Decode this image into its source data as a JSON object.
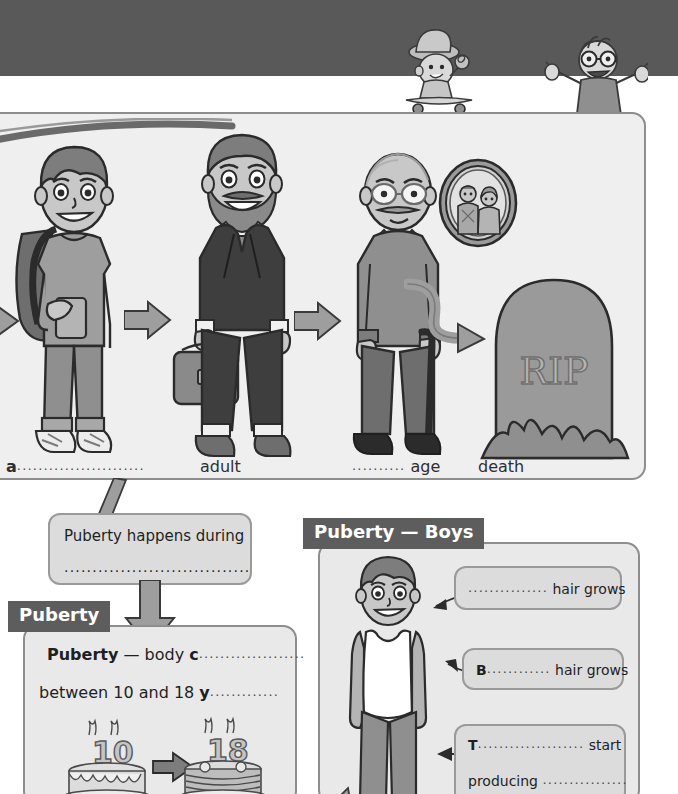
{
  "page": {
    "header_band_color": "#595959",
    "paper_color": "#ffffff"
  },
  "header_illustrations": [
    {
      "name": "baby-on-skateboard",
      "description": "cartoon baby wearing a cap holding a lollipop riding a skateboard"
    },
    {
      "name": "old-man-on-skateboard",
      "description": "cartoon old man with glasses riding a skateboard, arms raised"
    }
  ],
  "life_stages": {
    "panel_name": "life-stages-panel",
    "figures": [
      {
        "name": "teenager-figure",
        "description": "teenage boy with backpack holding a phone"
      },
      {
        "name": "adult-figure",
        "description": "bearded adult man in a suit holding a briefcase"
      },
      {
        "name": "old-man-figure",
        "description": "elderly man with a walking stick"
      },
      {
        "name": "gravestone-figure",
        "description": "gravestone with RIP engraved and grass"
      }
    ],
    "gravestone_text": "RIP",
    "photo_frame": "oval portrait of an elderly couple",
    "labels": [
      {
        "prefix": "a",
        "dots": "........................",
        "suffix": "",
        "x": 6
      },
      {
        "prefix": "",
        "dots": "",
        "suffix": "adult",
        "x": 200
      },
      {
        "prefix": "",
        "dots": "..........",
        "suffix": "age",
        "x": 352
      },
      {
        "prefix": "",
        "dots": "",
        "suffix": "death",
        "x": 478
      }
    ]
  },
  "puberty_happens_box": {
    "name": "puberty-happens-box",
    "line1": "Puberty happens during",
    "line2_dots": "................................."
  },
  "puberty_section": {
    "tab_label": "Puberty",
    "lines": [
      {
        "bold": "Puberty",
        "text": " — body ",
        "bold2": "c",
        "dots": "...................."
      },
      {
        "bold": "",
        "text": "between 10 and 18 ",
        "bold2": "y",
        "dots": "............."
      }
    ],
    "cake_illustration": {
      "left_cake_number": "10",
      "right_cake_number": "18",
      "arrow": "right-arrow"
    }
  },
  "puberty_boys_section": {
    "tab_label": "Puberty — Boys",
    "figure": "teenage boy in a white vest top",
    "callouts": [
      {
        "name": "facial-hair-callout",
        "bold": "",
        "dots": "...............",
        "text": " hair grows",
        "line2": ""
      },
      {
        "name": "body-hair-callout",
        "bold": "B",
        "dots": "............",
        "text": "  hair grows",
        "line2": ""
      },
      {
        "name": "testicles-callout",
        "bold": "T",
        "dots": "....................",
        "text": " start",
        "line2": "producing",
        "line2_dots": "................"
      }
    ]
  },
  "colors": {
    "header_band": "#595959",
    "tab_background": "#5d5d5d",
    "tab_text": "#ffffff",
    "panel_background": "#e9e9e9",
    "infobox_background": "#dcdcdc",
    "border": "#8d8d8d",
    "text": "#1f1f1f"
  }
}
